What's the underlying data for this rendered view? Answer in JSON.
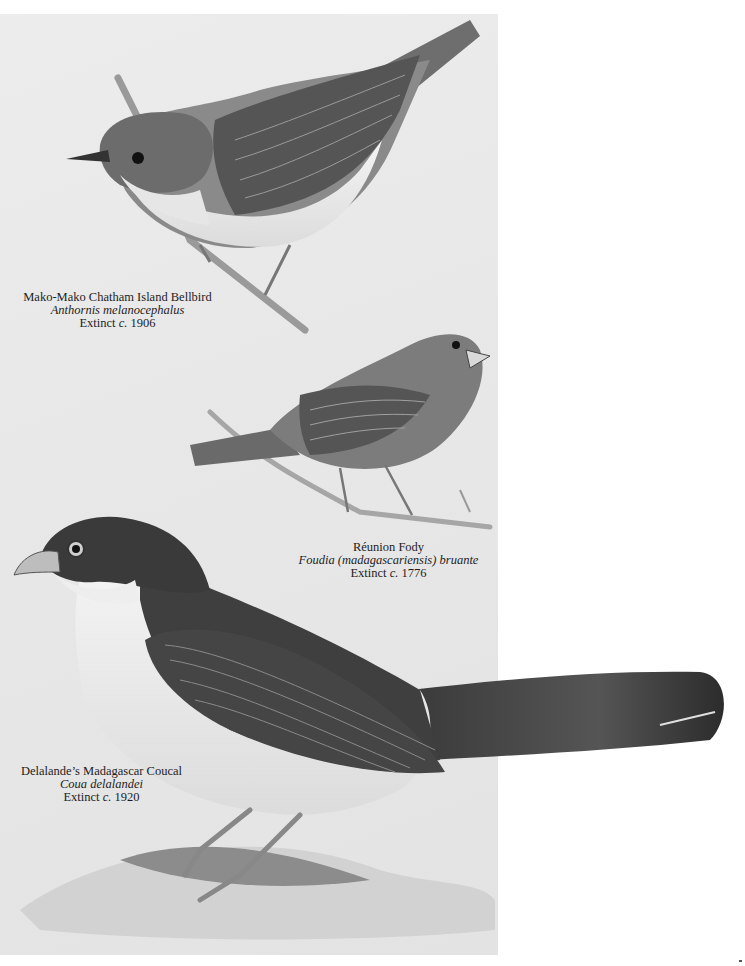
{
  "plate": {
    "description": "Illustrated plate of extinct birds",
    "birds": [
      {
        "common_name": "Mako-Mako Chatham Island Bellbird",
        "scientific_name": "Anthornis melanocephalus",
        "extinct_prefix": "Extinct ",
        "extinct_circa": "c.",
        "extinct_year": " 1906"
      },
      {
        "common_name": "Réunion Fody",
        "scientific_name": "Foudia (madagascariensis) bruante",
        "extinct_prefix": "Extinct ",
        "extinct_circa": "c.",
        "extinct_year": " 1776"
      },
      {
        "common_name": "Delalande’s Madagascar Coucal",
        "scientific_name": "Coua delalandei",
        "extinct_prefix": "Extinct ",
        "extinct_circa": "c.",
        "extinct_year": " 1920"
      }
    ]
  },
  "colors": {
    "plate_background": "#e8e8e8",
    "page_background": "#ffffff",
    "caption_text": "#1d1d1d"
  }
}
